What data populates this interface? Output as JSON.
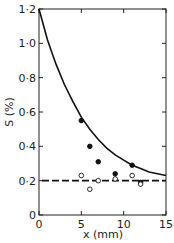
{
  "chart_data": {
    "type": "scatter",
    "title": "",
    "xlabel": "x (mm)",
    "ylabel": "S (%)",
    "xlim": [
      0,
      15
    ],
    "ylim": [
      0,
      1.2
    ],
    "grid": false,
    "x_ticks": [
      0,
      5,
      10,
      15
    ],
    "x_tick_labels": [
      "0",
      "5",
      "10",
      "15"
    ],
    "y_ticks": [
      0,
      0.2,
      0.4,
      0.6,
      0.8,
      1.0,
      1.2
    ],
    "y_tick_labels": [
      "0",
      "0·2",
      "0·4",
      "0·6",
      "0·8",
      "1·0",
      "1·2"
    ],
    "series": [
      {
        "name": "filled circles",
        "marker": "filled-circle",
        "x": [
          5,
          6,
          7,
          9,
          11,
          12
        ],
        "y": [
          0.55,
          0.4,
          0.31,
          0.24,
          0.29,
          0.19
        ]
      },
      {
        "name": "open circles",
        "marker": "open-circle",
        "x": [
          5,
          6,
          7,
          9,
          11,
          12
        ],
        "y": [
          0.23,
          0.15,
          0.2,
          0.21,
          0.23,
          0.18
        ]
      },
      {
        "name": "fitted curve",
        "style": "solid-line",
        "x": [
          0,
          1,
          2,
          3,
          4,
          5,
          6,
          7,
          8,
          9,
          10,
          11,
          12,
          13,
          14,
          15
        ],
        "y": [
          1.2,
          1.02,
          0.88,
          0.76,
          0.66,
          0.57,
          0.5,
          0.44,
          0.39,
          0.35,
          0.32,
          0.29,
          0.27,
          0.25,
          0.24,
          0.23
        ]
      },
      {
        "name": "baseline",
        "style": "dashed-line",
        "x": [
          0,
          15
        ],
        "y": [
          0.2,
          0.2
        ]
      }
    ],
    "legend": null
  }
}
